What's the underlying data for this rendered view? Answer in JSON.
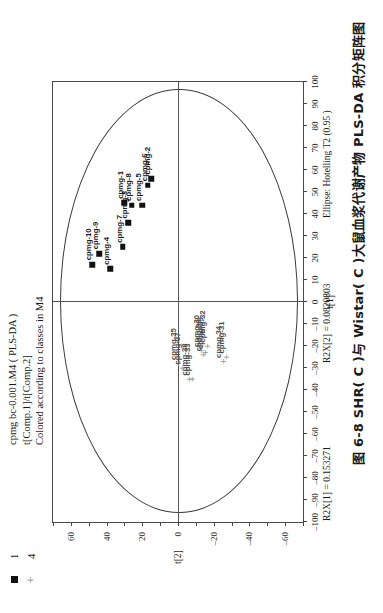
{
  "figure": {
    "titles": [
      "cpmg bc-0.001.M4 ( PLS-DA )",
      "t[Comp.1]/t[Comp.2]",
      "Colored according to classes in M4"
    ],
    "footer": {
      "r2x1": "R2X[1] = 0.153271",
      "r2x2": "R2X[2] = 0.0820803",
      "ellipse": "Ellipse: Hotelling T2  (0.95 )"
    },
    "caption": "图 6-8  SHR( C )与 Wistar( C )大鼠血浆代谢产物 PLS-DA 积分矩阵图"
  },
  "legend": {
    "items": [
      {
        "label": "1",
        "marker": "square",
        "color": "#111111"
      },
      {
        "label": "4",
        "marker": "plus",
        "color": "#9a9a9a"
      }
    ]
  },
  "chart_data": {
    "type": "scatter",
    "title": "cpmg bc-0.001.M4 ( PLS-DA )",
    "subtitle": "t[Comp.1]/t[Comp.2]",
    "xlabel": "t[1]",
    "ylabel": "t[2]",
    "xlim": [
      -100,
      100
    ],
    "ylim": [
      -70,
      70
    ],
    "xticks": [
      -100,
      -90,
      -80,
      -70,
      -60,
      -50,
      -40,
      -30,
      -20,
      -10,
      0,
      10,
      20,
      30,
      40,
      50,
      60,
      70,
      80,
      90,
      100
    ],
    "yticks": [
      -60,
      -40,
      -20,
      0,
      20,
      40,
      60
    ],
    "grid": false,
    "legend_position": "top-left",
    "annotations": {
      "ellipse": "Ellipse: Hotelling T2  (0.95 )",
      "ellipse_semi_x": 96,
      "ellipse_semi_y": 66
    },
    "series": [
      {
        "name": "1",
        "marker": "square",
        "color": "#111111",
        "points": [
          {
            "label": "cpmg-10",
            "x": 17,
            "y": 48
          },
          {
            "label": "cpmg-9",
            "x": 22,
            "y": 44
          },
          {
            "label": "cpmg-4",
            "x": 15,
            "y": 38
          },
          {
            "label": "cpmg-7",
            "x": 25,
            "y": 31
          },
          {
            "label": "cpmg-3",
            "x": 36,
            "y": 28
          },
          {
            "label": "cpmg-1",
            "x": 45,
            "y": 30
          },
          {
            "label": "cpmg-8",
            "x": 44,
            "y": 26
          },
          {
            "label": "cpmg-5",
            "x": 44,
            "y": 20
          },
          {
            "label": "cpmg-6",
            "x": 53,
            "y": 17
          },
          {
            "label": "cpmg-2",
            "x": 56,
            "y": 15
          }
        ]
      },
      {
        "name": "4",
        "marker": "plus",
        "color": "#9a9a9a",
        "points": [
          {
            "label": "cpmg-35",
            "x": -28,
            "y": 0
          },
          {
            "label": "cpmg-38",
            "x": -35,
            "y": -6
          },
          {
            "label": "cpmg-33",
            "x": -35,
            "y": -8
          },
          {
            "label": "cpmg-37",
            "x": -30,
            "y": -2
          },
          {
            "label": "cpmg-30",
            "x": -22,
            "y": -13
          },
          {
            "label": "cpmg-36",
            "x": -24,
            "y": -14
          },
          {
            "label": "cpmg-39",
            "x": -23,
            "y": -15
          },
          {
            "label": "cpmg-32",
            "x": -20,
            "y": -16
          },
          {
            "label": "cpmg-34",
            "x": -27,
            "y": -25
          },
          {
            "label": "cpmg-31",
            "x": -25,
            "y": -27
          }
        ]
      }
    ]
  }
}
